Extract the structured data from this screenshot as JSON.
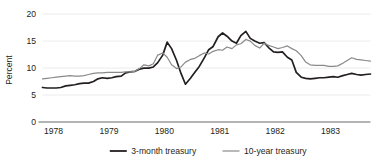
{
  "chart_data": {
    "type": "line",
    "title": "",
    "xlabel": "",
    "ylabel": "Percent",
    "xlim": [
      1978,
      1983.92
    ],
    "ylim": [
      0,
      21.5
    ],
    "yticks": [
      0,
      5,
      10,
      15,
      20
    ],
    "ytick_labels": [
      "0",
      "5",
      "10",
      "15",
      "20"
    ],
    "xticks": [
      1978,
      1979,
      1980,
      1981,
      1982,
      1983
    ],
    "xtick_labels": [
      "1978",
      "1979",
      "1980",
      "1981",
      "1982",
      "1983"
    ],
    "grid": "horizontal",
    "legend_position": "bottom-center",
    "colors": {
      "series_1": "#231f20",
      "series_2": "#8a8a8a",
      "gridline": "#e3e3e3",
      "axis": "#58595b",
      "text": "#231f20",
      "background": "#ffffff"
    },
    "series": [
      {
        "name": "3-month treasury",
        "color": "#231f20",
        "width": 1.7,
        "x": [
          1978.0,
          1978.08,
          1978.17,
          1978.25,
          1978.33,
          1978.42,
          1978.5,
          1978.58,
          1978.67,
          1978.75,
          1978.83,
          1978.92,
          1979.0,
          1979.08,
          1979.17,
          1979.25,
          1979.33,
          1979.42,
          1979.5,
          1979.58,
          1979.67,
          1979.75,
          1979.83,
          1979.92,
          1980.0,
          1980.08,
          1980.17,
          1980.25,
          1980.33,
          1980.42,
          1980.5,
          1980.58,
          1980.67,
          1980.75,
          1980.83,
          1980.92,
          1981.0,
          1981.08,
          1981.17,
          1981.25,
          1981.33,
          1981.42,
          1981.5,
          1981.58,
          1981.67,
          1981.75,
          1981.83,
          1981.92,
          1982.0,
          1982.08,
          1982.17,
          1982.25,
          1982.33,
          1982.42,
          1982.5,
          1982.58,
          1982.67,
          1982.75,
          1982.83,
          1982.92,
          1983.0,
          1983.08,
          1983.17,
          1983.25,
          1983.33,
          1983.42,
          1983.5,
          1983.58,
          1983.67,
          1983.75,
          1983.83,
          1983.92
        ],
        "values": [
          6.4,
          6.3,
          6.3,
          6.3,
          6.4,
          6.7,
          6.8,
          6.9,
          7.1,
          7.2,
          7.2,
          7.5,
          8.0,
          8.2,
          8.1,
          8.2,
          8.4,
          8.5,
          9.1,
          9.3,
          9.4,
          9.8,
          10.0,
          10.0,
          10.2,
          11.0,
          12.4,
          14.8,
          13.6,
          11.4,
          9.0,
          7.0,
          8.1,
          9.2,
          10.3,
          11.9,
          13.4,
          14.0,
          15.8,
          16.5,
          15.9,
          15.0,
          14.6,
          16.0,
          16.8,
          15.5,
          15.0,
          14.6,
          14.7,
          13.8,
          13.0,
          12.9,
          13.0,
          12.0,
          11.5,
          9.2,
          8.3,
          8.1,
          8.0,
          8.1,
          8.2,
          8.2,
          8.3,
          8.4,
          8.3,
          8.6,
          8.8,
          9.0,
          8.8,
          8.7,
          8.8,
          8.9
        ]
      },
      {
        "name": "10-year treasury",
        "color": "#8a8a8a",
        "width": 1.2,
        "x": [
          1978.0,
          1978.08,
          1978.17,
          1978.25,
          1978.33,
          1978.42,
          1978.5,
          1978.58,
          1978.67,
          1978.75,
          1978.83,
          1978.92,
          1979.0,
          1979.08,
          1979.17,
          1979.25,
          1979.33,
          1979.42,
          1979.5,
          1979.58,
          1979.67,
          1979.75,
          1979.83,
          1979.92,
          1980.0,
          1980.08,
          1980.17,
          1980.25,
          1980.33,
          1980.42,
          1980.5,
          1980.58,
          1980.67,
          1980.75,
          1980.83,
          1980.92,
          1981.0,
          1981.08,
          1981.17,
          1981.25,
          1981.33,
          1981.42,
          1981.5,
          1981.58,
          1981.67,
          1981.75,
          1981.83,
          1981.92,
          1982.0,
          1982.08,
          1982.17,
          1982.25,
          1982.33,
          1982.42,
          1982.5,
          1982.58,
          1982.67,
          1982.75,
          1982.83,
          1982.92,
          1983.0,
          1983.08,
          1983.17,
          1983.25,
          1983.33,
          1983.42,
          1983.5,
          1983.58,
          1983.67,
          1983.75,
          1983.83,
          1983.92
        ],
        "values": [
          8.0,
          8.1,
          8.2,
          8.3,
          8.4,
          8.5,
          8.6,
          8.5,
          8.5,
          8.6,
          8.8,
          9.0,
          9.1,
          9.1,
          9.2,
          9.2,
          9.2,
          9.2,
          9.3,
          9.3,
          9.4,
          9.9,
          10.6,
          10.4,
          10.8,
          12.4,
          12.8,
          12.0,
          10.6,
          9.9,
          10.2,
          11.1,
          11.6,
          11.8,
          12.3,
          12.8,
          12.6,
          13.1,
          13.4,
          13.3,
          13.9,
          13.6,
          14.3,
          14.5,
          15.3,
          15.0,
          14.2,
          13.7,
          14.6,
          14.2,
          13.9,
          13.6,
          13.8,
          14.1,
          13.6,
          13.2,
          12.3,
          11.1,
          10.6,
          10.5,
          10.5,
          10.5,
          10.3,
          10.3,
          10.4,
          10.9,
          11.4,
          11.9,
          11.6,
          11.5,
          11.4,
          11.3
        ]
      }
    ],
    "legend": [
      {
        "label": "3-month treasury",
        "color": "#231f20",
        "width": 1.8
      },
      {
        "label": "10-year treasury",
        "color": "#8a8a8a",
        "width": 1.2
      }
    ]
  }
}
